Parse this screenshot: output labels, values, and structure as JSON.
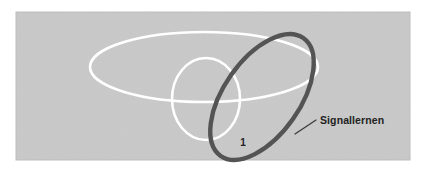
{
  "figure": {
    "name": "signal-learning-diagram",
    "panel": {
      "background_color": "#c9c9c9",
      "page_background_color": "#ffffff",
      "x": 16,
      "y": 12,
      "width": 394,
      "height": 148
    },
    "shapes": [
      {
        "id": "large-white-ellipse",
        "kind": "ellipse",
        "stroke_color": "#ffffff",
        "stroke_width": 2.6,
        "cx": 204,
        "cy": 67,
        "rx": 114,
        "ry": 35,
        "rotation_deg": 0
      },
      {
        "id": "small-white-circle",
        "kind": "ellipse",
        "stroke_color": "#ffffff",
        "stroke_width": 2.6,
        "cx": 206,
        "cy": 99,
        "rx": 34,
        "ry": 41,
        "rotation_deg": 0
      },
      {
        "id": "dark-signal-ellipse",
        "kind": "ellipse",
        "stroke_color": "#545454",
        "stroke_width": 4.4,
        "cx": 262,
        "cy": 97,
        "rx": 72,
        "ry": 38,
        "rotation_deg": -55
      }
    ],
    "leader_line": {
      "id": "signal-leader-line",
      "stroke_color": "#3a3a3a",
      "stroke_width": 1.3,
      "x1": 295,
      "y1": 134,
      "x2": 316,
      "y2": 120
    },
    "labels": [
      {
        "id": "signal-label",
        "text": "Signallernen",
        "x": 320,
        "y": 124,
        "color": "#222222",
        "anchor": "start",
        "bold": true
      },
      {
        "id": "region-one-label",
        "text": "1",
        "x": 243,
        "y": 146,
        "color": "#222222",
        "anchor": "middle",
        "bold": true
      }
    ]
  }
}
